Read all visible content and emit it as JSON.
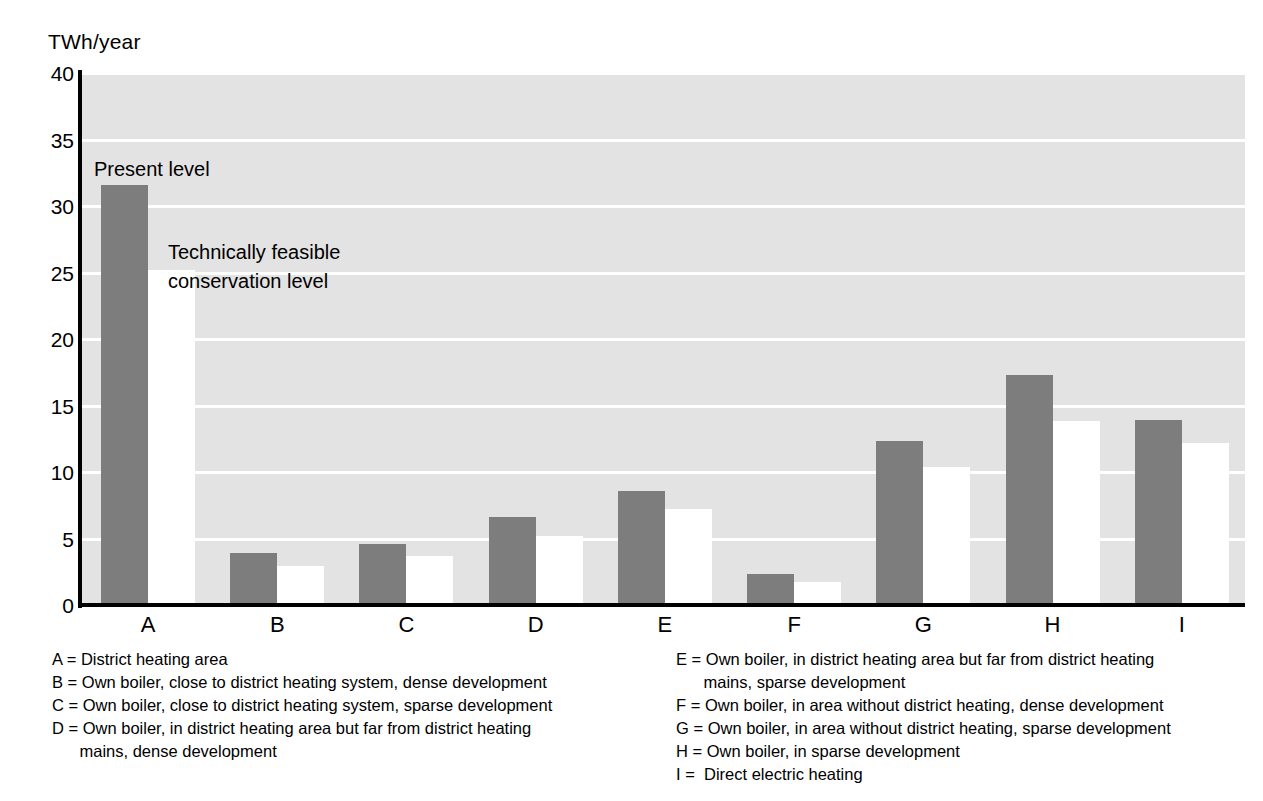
{
  "axis": {
    "unit_label": "TWh/year",
    "y_ticks": [
      "40",
      "35",
      "30",
      "25",
      "20",
      "15",
      "10",
      "5",
      "0"
    ],
    "x_labels": [
      "A",
      "B",
      "C",
      "D",
      "E",
      "F",
      "G",
      "H",
      "I"
    ]
  },
  "annotations": {
    "present": "Present level",
    "feasible_line1": "Technically feasible",
    "feasible_line2": "conservation level"
  },
  "legend": {
    "left": [
      "A = District heating area",
      "B = Own boiler, close to district heating system, dense development",
      "C = Own boiler, close to district heating system, sparse development",
      "D = Own boiler, in district heating area but far from district heating\n      mains, dense development"
    ],
    "right": [
      "E = Own boiler, in district heating area but far from district heating\n      mains, sparse development",
      "F = Own boiler, in area without district heating, dense development",
      "G = Own boiler, in area without district heating, sparse development",
      "H = Own boiler, in sparse development",
      "I =  Direct electric heating"
    ]
  },
  "colors": {
    "present_bar": "#7d7d7d",
    "feasible_bar": "#ffffff",
    "plot_background": "#e3e3e3",
    "gridline": "#ffffff",
    "axis": "#000000"
  },
  "chart_data": {
    "type": "bar",
    "title": "",
    "xlabel": "",
    "ylabel": "TWh/year",
    "ylim": [
      0,
      40
    ],
    "ytick_step": 5,
    "grid": true,
    "legend_position": "in-plot annotations",
    "categories": [
      "A",
      "B",
      "C",
      "D",
      "E",
      "F",
      "G",
      "H",
      "I"
    ],
    "category_descriptions": [
      "District heating area",
      "Own boiler, close to district heating system, dense development",
      "Own boiler, close to district heating system, sparse development",
      "Own boiler, in district heating area but far from district heating mains, dense development",
      "Own boiler, in district heating area but far from district heating mains, sparse development",
      "Own boiler, in area without district heating, dense development",
      "Own boiler, in area without district heating, sparse development",
      "Own boiler, in sparse development",
      "Direct electric heating"
    ],
    "series": [
      {
        "name": "Present level",
        "color": "#7d7d7d",
        "values": [
          31.6,
          3.9,
          4.6,
          6.6,
          8.6,
          2.3,
          12.3,
          17.3,
          13.9
        ]
      },
      {
        "name": "Technically feasible conservation level",
        "color": "#ffffff",
        "values": [
          25.2,
          2.9,
          3.7,
          5.2,
          7.2,
          1.7,
          10.4,
          13.8,
          12.2
        ]
      }
    ]
  }
}
